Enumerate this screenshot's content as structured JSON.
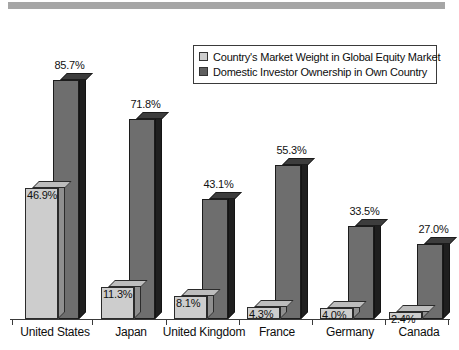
{
  "chart_data": {
    "type": "bar",
    "title": "",
    "xlabel": "",
    "ylabel": "",
    "ylim": [
      0,
      100
    ],
    "grid": false,
    "legend_position": "upper-right",
    "categories": [
      "United States",
      "Japan",
      "United Kingdom",
      "France",
      "Germany",
      "Canada"
    ],
    "series": [
      {
        "name": "Country's Market Weight in Global Equity Market",
        "color": "#cdcdcd",
        "values": [
          46.9,
          11.3,
          8.1,
          4.3,
          4.0,
          2.4
        ],
        "labels": [
          "46.9%",
          "11.3%",
          "8.1%",
          "4.3%",
          "4.0%",
          "2.4%"
        ]
      },
      {
        "name": "Domestic Investor Ownership in Own Country",
        "color": "#6e6e6e",
        "values": [
          85.7,
          71.8,
          43.1,
          55.3,
          33.5,
          27.0
        ],
        "labels": [
          "85.7%",
          "71.8%",
          "43.1%",
          "55.3%",
          "33.5%",
          "27.0%"
        ]
      }
    ]
  },
  "legend": {
    "items": [
      {
        "label": "Country's Market Weight in Global Equity Market",
        "swatch": "light"
      },
      {
        "label": "Domestic Investor Ownership in Own Country",
        "swatch": "dark"
      }
    ]
  },
  "colors": {
    "banner": "#a6a6a6",
    "light_bar": "#cdcdcd",
    "dark_bar": "#6e6e6e",
    "axis": "#3a3a3a",
    "text": "#0d0d0d"
  }
}
